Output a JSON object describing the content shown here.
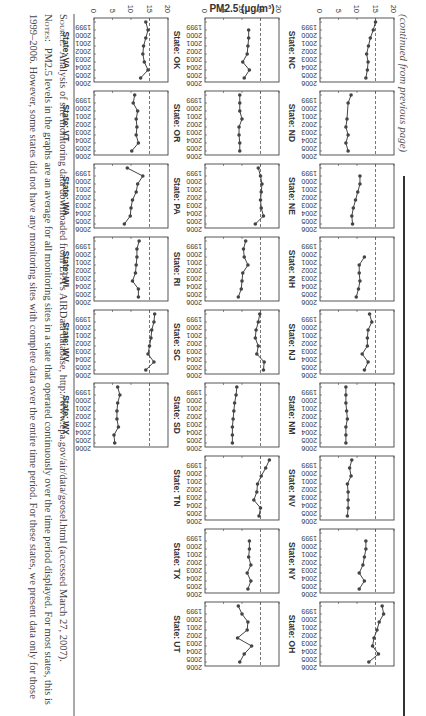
{
  "page": {
    "continued_note": "(continued from previous page)",
    "orientation": "rotated 90 degrees clockwise"
  },
  "footer": {
    "source_label": "Source:",
    "source_text": "Analysis of site monitoring data downloaded from EPA's AIRData database, http://www.epa.gov/air/data/geosel.html (accessed March 27, 2007).",
    "notes_label": "Notes:",
    "notes_line1": "PM2.5 levels in the graphs are an average for all monitoring sites in a state that operated continuously over the time period displayed. For most states, this is",
    "notes_line2": "1999–2006. However, some states did not have any monitoring sites with complete data over the entire time period. For these states, we present data only for those"
  },
  "chart_data": {
    "type": "line",
    "title": "",
    "ylabel": "PM2.5 (µg/m³)",
    "xlabel": "",
    "x": [
      1999,
      2000,
      2001,
      2002,
      2003,
      2004,
      2005,
      2006
    ],
    "x_tick_labels": [
      "1999",
      "2000",
      "2001",
      "2002",
      "2003",
      "2004",
      "2005",
      "2006"
    ],
    "y_ticks": [
      0,
      5,
      10,
      15,
      20
    ],
    "ylim": [
      0,
      20
    ],
    "reference_line": {
      "value": 15,
      "style": "dashed"
    },
    "grid": false,
    "legend": "none",
    "panels": [
      {
        "row": 0,
        "col": 0,
        "label": "State: NC",
        "values": [
          15.0,
          14.4,
          13.6,
          13.1,
          12.6,
          13.0,
          12.8,
          12.4
        ]
      },
      {
        "row": 0,
        "col": 1,
        "label": "State: ND",
        "values": [
          8.4,
          7.6,
          null,
          7.3,
          7.0,
          7.6,
          7.0,
          7.6
        ],
        "years_override": [
          1999,
          2000,
          2001,
          2002,
          2003,
          2004,
          2005,
          2006
        ],
        "values_full": [
          8.2,
          7.4,
          7.6,
          7.1,
          7.8,
          7.0,
          6.9,
          7.8
        ]
      },
      {
        "row": 0,
        "col": 2,
        "label": "State: NE",
        "values": [
          null,
          10.8,
          10.8,
          10.2,
          9.6,
          9.0,
          8.6,
          8.8
        ]
      },
      {
        "row": 0,
        "col": 3,
        "label": "State: NH",
        "values": [
          null,
          null,
          12.0,
          10.6,
          10.6,
          10.8,
          10.4,
          9.8
        ]
      },
      {
        "row": 0,
        "col": 4,
        "label": "State: NJ",
        "values": [
          13.4,
          14.0,
          13.0,
          12.8,
          12.8,
          11.4,
          13.0,
          12.0
        ]
      },
      {
        "row": 0,
        "col": 5,
        "label": "State: NM",
        "values": [
          7.0,
          7.0,
          7.0,
          7.2,
          7.4,
          7.0,
          7.0,
          7.0
        ]
      },
      {
        "row": 0,
        "col": 6,
        "label": "State: NV",
        "values": [
          8.6,
          8.0,
          8.4,
          7.4,
          7.6,
          7.6,
          7.6,
          7.4
        ]
      },
      {
        "row": 0,
        "col": 7,
        "label": "State: NY",
        "values": [
          null,
          12.4,
          12.4,
          12.0,
          11.6,
          10.6,
          12.0,
          10.6
        ]
      },
      {
        "row": 0,
        "col": 8,
        "label": "State: OH",
        "values": [
          16.8,
          17.2,
          16.0,
          15.4,
          14.6,
          14.2,
          15.8,
          13.2
        ]
      },
      {
        "row": 1,
        "col": 0,
        "label": "State: OK",
        "values": [
          null,
          11.8,
          11.8,
          11.6,
          11.4,
          10.2,
          12.0,
          10.6
        ]
      },
      {
        "row": 1,
        "col": 1,
        "label": "State: OR",
        "values": [
          9.4,
          9.4,
          9.4,
          10.0,
          9.2,
          9.2,
          9.4,
          9.4
        ]
      },
      {
        "row": 1,
        "col": 2,
        "label": "State: PA",
        "values": [
          14.4,
          15.0,
          15.4,
          15.2,
          15.0,
          15.2,
          15.8,
          13.6
        ]
      },
      {
        "row": 1,
        "col": 3,
        "label": "State: RI",
        "values": [
          11.0,
          10.4,
          10.6,
          11.6,
          10.2,
          10.0,
          9.8,
          9.0
        ]
      },
      {
        "row": 1,
        "col": 4,
        "label": "State: SC",
        "values": [
          14.8,
          14.4,
          13.8,
          13.6,
          14.4,
          14.0,
          16.0,
          15.8
        ]
      },
      {
        "row": 1,
        "col": 5,
        "label": "State: SD",
        "values": [
          8.6,
          8.4,
          8.0,
          7.8,
          7.6,
          7.4,
          7.4,
          7.4
        ]
      },
      {
        "row": 1,
        "col": 6,
        "label": "State: TN",
        "values": [
          17.4,
          16.4,
          15.2,
          14.2,
          14.0,
          13.2,
          15.0,
          14.6
        ]
      },
      {
        "row": 1,
        "col": 7,
        "label": "State: TX",
        "values": [
          null,
          12.0,
          12.0,
          11.8,
          12.4,
          11.4,
          12.4,
          11.6
        ]
      },
      {
        "row": 1,
        "col": 8,
        "label": "State: UT",
        "values": [
          9.0,
          10.0,
          11.6,
          11.4,
          8.8,
          12.6,
          10.6,
          9.4
        ]
      },
      {
        "row": 2,
        "col": 0,
        "label": "State: VA",
        "values": [
          14.0,
          14.6,
          14.0,
          13.4,
          13.2,
          13.6,
          14.6,
          12.6
        ]
      },
      {
        "row": 2,
        "col": 1,
        "label": "State: VT",
        "values": [
          11.0,
          10.6,
          11.8,
          11.4,
          11.6,
          11.4,
          12.0,
          10.2
        ]
      },
      {
        "row": 2,
        "col": 2,
        "label": "State: WA",
        "values": [
          9.0,
          13.2,
          11.8,
          11.4,
          10.4,
          10.0,
          9.8,
          8.2
        ]
      },
      {
        "row": 2,
        "col": 3,
        "label": "State: WI",
        "values": [
          12.2,
          11.6,
          11.6,
          11.4,
          11.2,
          10.4,
          12.0,
          12.0
        ]
      },
      {
        "row": 2,
        "col": 4,
        "label": "State: WV",
        "values": [
          16.4,
          16.2,
          15.6,
          15.4,
          15.0,
          14.6,
          16.2,
          14.0
        ]
      },
      {
        "row": 2,
        "col": 5,
        "label": "State: WY",
        "values": [
          6.4,
          7.0,
          6.4,
          6.2,
          6.2,
          6.6,
          5.4,
          5.6
        ]
      }
    ]
  }
}
